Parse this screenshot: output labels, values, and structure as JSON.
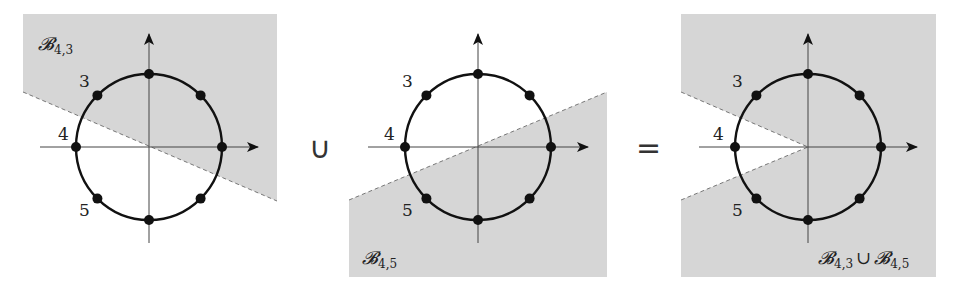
{
  "figure": {
    "region_color": "#d6d6d6",
    "line_color": "#111111",
    "axis_color": "#444444",
    "dash_color": "#777777",
    "operators": {
      "union": "∪",
      "equals": "="
    },
    "panels": [
      {
        "id": "panel-1",
        "set_symbol": "𝓑",
        "set_subscript": "4,3",
        "labels": {
          "three": "3",
          "four": "4",
          "five": "5"
        }
      },
      {
        "id": "panel-2",
        "set_symbol": "𝓑",
        "set_subscript": "4,5",
        "labels": {
          "three": "3",
          "four": "4",
          "five": "5"
        }
      },
      {
        "id": "panel-3",
        "set_symbol_a": "𝓑",
        "set_subscript_a": "4,3",
        "union": "∪",
        "set_symbol_b": "𝓑",
        "set_subscript_b": "4,5",
        "labels": {
          "three": "3",
          "four": "4",
          "five": "5"
        }
      }
    ],
    "circle": {
      "radius": 73,
      "dots": 8
    }
  }
}
